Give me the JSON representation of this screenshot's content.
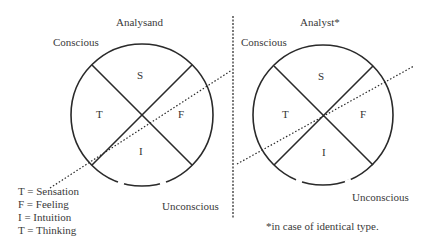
{
  "left_panel": {
    "title": "Analysand",
    "conscious_label": "Conscious",
    "unconscious_label": "Unconscious",
    "quadrants": {
      "top": "S",
      "left": "T",
      "right": "F",
      "bottom": "I"
    }
  },
  "right_panel": {
    "title": "Analyst*",
    "conscious_label": "Conscious",
    "unconscious_label": "Unconscious",
    "quadrants": {
      "top": "S",
      "left": "T",
      "right": "F",
      "bottom": "I"
    }
  },
  "legend": [
    "T = Sensation",
    "F = Feeling",
    "I = Intuition",
    "T = Thinking"
  ],
  "footnote": "*in case of identical type."
}
